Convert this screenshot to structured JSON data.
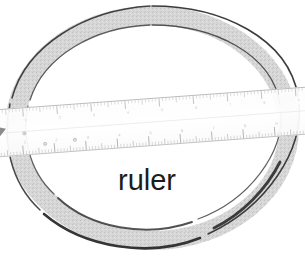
{
  "scene": {
    "width": 305,
    "height": 279,
    "background_color": "#ffffff",
    "description": "Hand-drawn gray elliptical ring with a translucent ruler laid across it"
  },
  "label": {
    "text": "ruler",
    "color": "#1c1c1c",
    "x": 118,
    "y": 190
  },
  "ring": {
    "name": "elliptical-ring",
    "fill_color": "#d6d6d6",
    "outline_color": "#2b2b2b",
    "center_x": 152,
    "center_y": 128,
    "outer_rx": 148,
    "outer_ry": 123,
    "inner_rx": 128,
    "inner_ry": 104,
    "band_thickness": 20
  },
  "ruler": {
    "name": "translucent-ruler",
    "body_color": "#fbfbfb",
    "edge_color": "#c9c9c9",
    "tick_color": "#9a9a9a",
    "angle_deg": -4.2,
    "left_x": 0,
    "right_x": 305,
    "top_edge_y": 100,
    "bottom_edge_y": 143,
    "end_wedge_color": "#8e8e8e",
    "scales": [
      {
        "name": "top-scale",
        "unit": "mm",
        "major_every": 10,
        "minor_count": 96,
        "labels": [
          "1",
          "2",
          "3",
          "4",
          "5",
          "6",
          "7",
          "8",
          "9",
          "10",
          "11",
          "12"
        ]
      },
      {
        "name": "bottom-scale",
        "unit": "cm",
        "major_every": 10,
        "minor_count": 104,
        "labels": [
          "1",
          "2",
          "3",
          "4",
          "5",
          "6",
          "7",
          "8",
          "9",
          "10",
          "11"
        ]
      }
    ],
    "rivets": [
      {
        "x": 24,
        "y": 124
      },
      {
        "x": 44,
        "y": 136
      },
      {
        "x": 74,
        "y": 134
      }
    ]
  }
}
